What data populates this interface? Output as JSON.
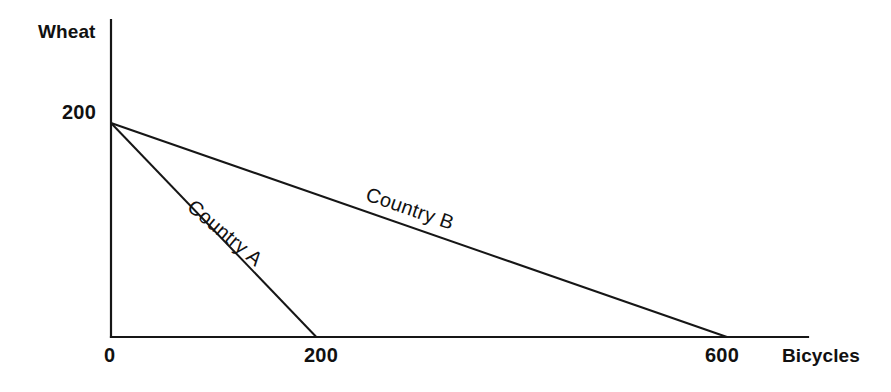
{
  "chart_data": {
    "type": "line",
    "title": "",
    "subtitle": "",
    "xlabel": "Bicycles",
    "ylabel": "Wheat",
    "grid": false,
    "legend": "inline-annotations",
    "xlim": [
      0,
      700
    ],
    "ylim": [
      0,
      260
    ],
    "x_ticks": [
      {
        "value": 0,
        "label": "0"
      },
      {
        "value": 200,
        "label": "200"
      },
      {
        "value": 600,
        "label": "600"
      }
    ],
    "y_ticks": [
      {
        "value": 200,
        "label": "200"
      }
    ],
    "series": [
      {
        "name": "Country A",
        "annotation": "Country A",
        "x": [
          0,
          200
        ],
        "y": [
          200,
          0
        ],
        "color": "#161616"
      },
      {
        "name": "Country B",
        "annotation": "Country B",
        "x": [
          0,
          600
        ],
        "y": [
          200,
          0
        ],
        "color": "#161616"
      }
    ]
  },
  "axes": {
    "y_axis_title": "Wheat",
    "x_axis_title": "Bicycles",
    "origin_label": "0",
    "y_tick_200": "200",
    "x_tick_200": "200",
    "x_tick_600": "600"
  },
  "annotations": {
    "country_a": "Country A",
    "country_b": "Country B"
  },
  "colors": {
    "background": "#ffffff",
    "line": "#161616",
    "text": "#111111"
  }
}
